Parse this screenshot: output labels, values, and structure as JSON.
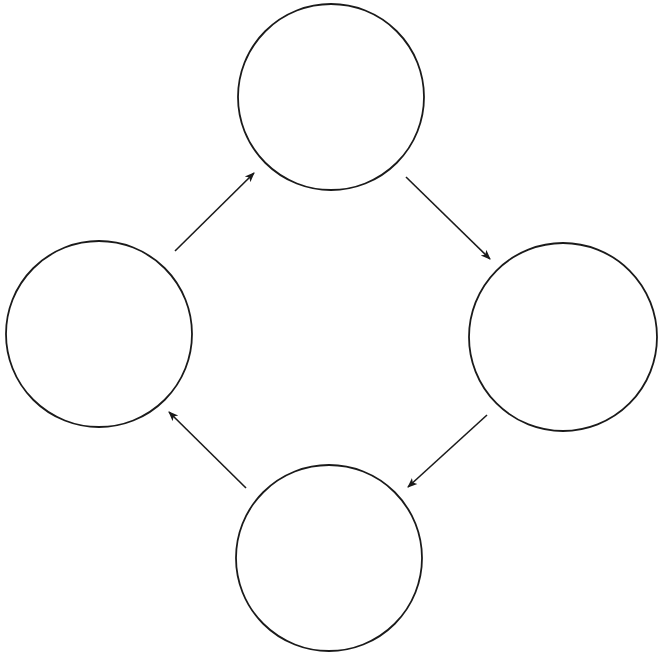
{
  "diagram": {
    "type": "cycle",
    "width": 658,
    "height": 658,
    "stroke_color": "#1a1a1a",
    "background": "#ffffff",
    "nodes": [
      {
        "id": "top",
        "label": "",
        "cx": 331,
        "cy": 97,
        "r": 93
      },
      {
        "id": "right",
        "label": "",
        "cx": 563,
        "cy": 337,
        "r": 94
      },
      {
        "id": "bottom",
        "label": "",
        "cx": 329,
        "cy": 558,
        "r": 93
      },
      {
        "id": "left",
        "label": "",
        "cx": 99,
        "cy": 334,
        "r": 93
      }
    ],
    "edges": [
      {
        "from": "left",
        "to": "top",
        "x1": 175,
        "y1": 251,
        "x2": 254,
        "y2": 173
      },
      {
        "from": "top",
        "to": "right",
        "x1": 406,
        "y1": 177,
        "x2": 490,
        "y2": 259
      },
      {
        "from": "right",
        "to": "bottom",
        "x1": 487,
        "y1": 415,
        "x2": 408,
        "y2": 487
      },
      {
        "from": "bottom",
        "to": "left",
        "x1": 246,
        "y1": 488,
        "x2": 169,
        "y2": 412
      }
    ]
  }
}
